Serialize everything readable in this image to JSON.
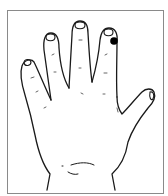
{
  "figure": {
    "marker": {
      "color": "#000000",
      "location": "index fingertip"
    },
    "colors": {
      "line": "#1a1a1a",
      "frame": "#8a8a8a",
      "background": "#ffffff"
    }
  }
}
